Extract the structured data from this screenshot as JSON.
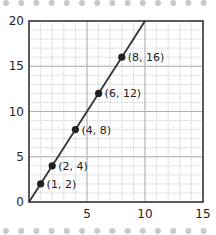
{
  "chart_data": {
    "type": "line",
    "title": "",
    "xlabel": "",
    "ylabel": "",
    "xlim": [
      0,
      15
    ],
    "ylim": [
      0,
      20
    ],
    "grid": true,
    "minor_grid_step": 1,
    "x_ticks": [
      0,
      5,
      10,
      15
    ],
    "y_ticks": [
      0,
      5,
      10,
      15,
      20
    ],
    "x_tick_labels": [
      "5",
      "10",
      "15"
    ],
    "y_tick_labels": [
      "0",
      "5",
      "10",
      "15",
      "20"
    ],
    "line": {
      "slope": 2,
      "intercept": 0,
      "x_start": 0,
      "x_end": 10
    },
    "points": [
      {
        "x": 1,
        "y": 2,
        "label": "(1, 2)"
      },
      {
        "x": 2,
        "y": 4,
        "label": "(2, 4)"
      },
      {
        "x": 4,
        "y": 8,
        "label": "(4, 8)"
      },
      {
        "x": 6,
        "y": 12,
        "label": "(6, 12)"
      },
      {
        "x": 8,
        "y": 16,
        "label": "(8, 16)"
      }
    ],
    "colors": {
      "line": "#333333",
      "point": "#222222",
      "grid": "#c8c8c8",
      "frame": "#333333",
      "decor_dots": "#c9c9c9"
    }
  }
}
